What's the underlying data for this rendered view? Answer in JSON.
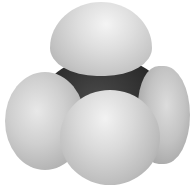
{
  "image": {
    "subject": "methane molecule space-filling model",
    "atoms": [
      {
        "id": "carbon",
        "element": "C",
        "color": "#2c2c2c"
      },
      {
        "id": "h-top",
        "element": "H",
        "color": "#dedede"
      },
      {
        "id": "h-left",
        "element": "H",
        "color": "#cfcfcf"
      },
      {
        "id": "h-right",
        "element": "H",
        "color": "#c3c3c3"
      },
      {
        "id": "h-front",
        "element": "H",
        "color": "#dadada"
      }
    ],
    "background": "#ffffff"
  }
}
